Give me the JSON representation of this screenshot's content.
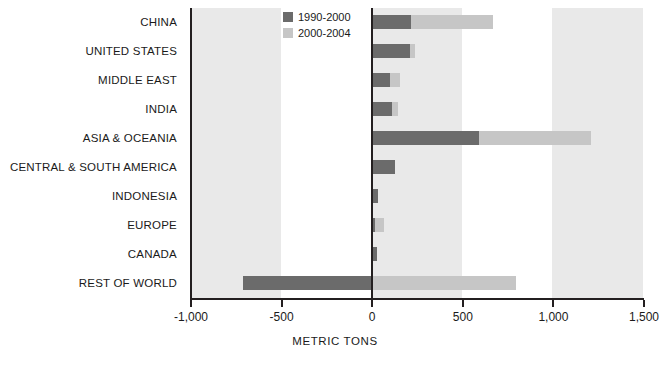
{
  "chart_data": {
    "type": "bar",
    "orientation": "horizontal",
    "stacked": true,
    "title": "",
    "xlabel": "METRIC TONS",
    "ylabel": "",
    "xlim": [
      -1000,
      1500
    ],
    "xticks": [
      -1000,
      -500,
      0,
      500,
      1000,
      1500
    ],
    "xtick_labels": [
      "-1,000",
      "-500",
      "0",
      "500",
      "1,000",
      "1,500"
    ],
    "grid": false,
    "banded_background": true,
    "legend_position": "top-center",
    "categories": [
      "CHINA",
      "UNITED STATES",
      "MIDDLE EAST",
      "INDIA",
      "ASIA & OCEANIA",
      "CENTRAL & SOUTH AMERICA",
      "INDONESIA",
      "EUROPE",
      "CANADA",
      "REST OF WORLD"
    ],
    "series": [
      {
        "name": "1990-2000",
        "color": "#6b6b6b",
        "values": [
          220,
          215,
          105,
          115,
          595,
          130,
          40,
          20,
          30,
          -705
        ]
      },
      {
        "name": "2000-2004",
        "color": "#c6c6c6",
        "values": [
          450,
          25,
          55,
          35,
          620,
          0,
          0,
          50,
          0,
          1505
        ]
      }
    ],
    "cumulative_totals": [
      670,
      240,
      160,
      150,
      1215,
      130,
      40,
      70,
      30,
      800
    ],
    "legend": [
      {
        "label": "1990-2000",
        "color": "#6b6b6b"
      },
      {
        "label": "2000-2004",
        "color": "#c6c6c6"
      }
    ],
    "colors": {
      "series_1990_2000": "#6b6b6b",
      "series_2000_2004": "#c6c6c6",
      "band": "#e9e9e9",
      "axis": "#231f20",
      "background": "#ffffff",
      "text": "#1a1a1a"
    }
  }
}
